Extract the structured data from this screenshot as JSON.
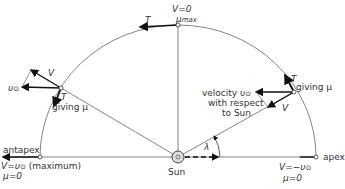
{
  "diagram": {
    "top": {
      "v_label": "V=0",
      "mu_label": "μ",
      "mu_sub": "max",
      "t_label": "T"
    },
    "left": {
      "v0_label": "υ",
      "v0_sub": "⊙",
      "v_label": "V",
      "t_label": "T",
      "giving": "giving μ"
    },
    "right": {
      "t_label": "T",
      "giving": "giving μ",
      "velocity_line1": "velocity υ",
      "velocity_sub": "⊙",
      "velocity_line2": "with respect",
      "velocity_line3": "to Sun",
      "v_label": "V"
    },
    "antapex": {
      "label": "antapex",
      "v_label": "V=υ",
      "v_sub": "⊙",
      "v_suffix": " (maximum)",
      "mu_label": "μ=0"
    },
    "apex": {
      "label": "apex",
      "v_label": "V=−υ",
      "v_sub": "⊙",
      "mu_label": "μ=0"
    },
    "center": {
      "sun_label": "Sun",
      "angle_label": "λ"
    },
    "colors": {
      "line": "#555555",
      "arrow": "#111111",
      "text": "#333333"
    }
  }
}
